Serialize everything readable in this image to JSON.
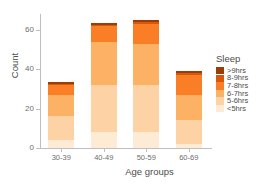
{
  "chart_data": {
    "type": "bar",
    "title": "",
    "subtitle": "",
    "xlabel": "Age groups",
    "ylabel": "Count",
    "categories": [
      "30-39",
      "40-49",
      "50-59",
      "60-69"
    ],
    "stacked": true,
    "legend": {
      "title": "Sleep",
      "position": "right",
      "entries": [
        "&gt;9hrs",
        "8-9hrs",
        "7-8hrs",
        "6-7hrs",
        "5-6hrs",
        "&lt;5hrs"
      ]
    },
    "series": [
      {
        "name": "<5hrs",
        "color": "#fdebd5",
        "values": [
          4,
          8,
          8,
          2
        ]
      },
      {
        "name": "5-6hrs",
        "color": "#fdd3a5",
        "values": [
          12,
          24,
          24,
          12
        ]
      },
      {
        "name": "6-7hrs",
        "color": "#fdb165",
        "values": [
          11,
          22,
          21,
          13
        ]
      },
      {
        "name": "7-8hrs",
        "color": "#f97e26",
        "values": [
          5,
          8,
          10,
          10
        ]
      },
      {
        "name": "8-9hrs",
        "color": "#d95709",
        "values": [
          0.5,
          0.5,
          1,
          1
        ]
      },
      {
        "name": ">9hrs",
        "color": "#9b3d07",
        "values": [
          1,
          1,
          1,
          1
        ]
      }
    ],
    "totals": [
      33,
      63,
      65,
      39
    ],
    "ylim": [
      0,
      68
    ],
    "yticks": [
      0,
      20,
      40,
      60
    ],
    "ytick_labels": [
      "0",
      "20",
      "40",
      "60"
    ],
    "grid": false,
    "axis_color": "#bfbfbf",
    "background": "#ffffff"
  }
}
